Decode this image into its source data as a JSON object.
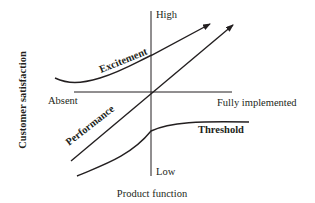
{
  "diagram": {
    "y_axis_label": "Customer satisfaction",
    "x_axis_label": "Product function",
    "axis_labels": {
      "top": "High",
      "bottom": "Low",
      "left": "Absent",
      "right": "Fully implemented"
    },
    "curves": [
      {
        "id": "excitement",
        "label": "Excitement",
        "shape": "convex, rising",
        "arrow": true
      },
      {
        "id": "performance",
        "label": "Performance",
        "shape": "linear, rising",
        "arrow": true
      },
      {
        "id": "threshold",
        "label": "Threshold",
        "shape": "concave, saturating",
        "arrow": false
      }
    ],
    "colors": {
      "line": "#231f20",
      "background": "#ffffff"
    }
  }
}
